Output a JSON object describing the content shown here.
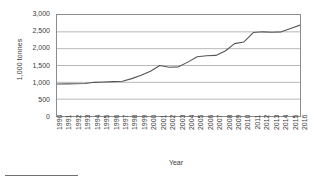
{
  "chart_data": {
    "type": "line",
    "title": "",
    "xlabel": "Year",
    "ylabel": "1,000 tonnes",
    "ylim": [
      0,
      3000
    ],
    "ytick_values": [
      3000,
      2500,
      2000,
      1500,
      1000,
      500,
      0
    ],
    "ytick_labels": [
      "3,000",
      "2,500",
      "2,000",
      "1,500",
      "1,000",
      "500",
      "0"
    ],
    "grid": true,
    "legend": "none",
    "line_color": "#555555",
    "categories": [
      "1990",
      "1991",
      "1992",
      "1993",
      "1994",
      "1995",
      "1996",
      "1997",
      "1998",
      "1999",
      "2000",
      "2001",
      "2002",
      "2003",
      "2004",
      "2005",
      "2006",
      "2007",
      "2008",
      "2009",
      "2010",
      "2011",
      "2012",
      "2013",
      "2014",
      "2015",
      "2016"
    ],
    "series": [
      {
        "name": "Production",
        "values": [
          950,
          955,
          960,
          965,
          1000,
          1010,
          1020,
          1030,
          1110,
          1210,
          1330,
          1500,
          1450,
          1460,
          1600,
          1760,
          1790,
          1800,
          1930,
          2150,
          2200,
          2480,
          2500,
          2490,
          2500,
          2600,
          2700
        ]
      }
    ]
  },
  "footnote": {
    "rule": true
  }
}
